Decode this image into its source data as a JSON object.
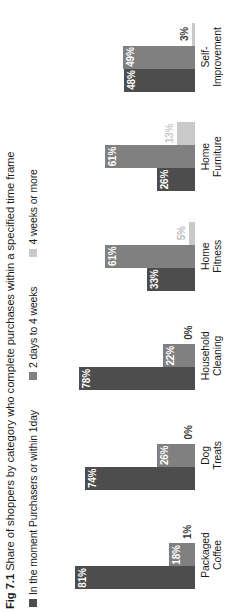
{
  "caption": {
    "figure_number": "Fig 7.1",
    "text": "Share of shoppers by category who complete purchases within a specified time frame"
  },
  "legend": {
    "items": [
      {
        "label": "In the moment Purchasers or within 1day",
        "color": "#4d4d4d"
      },
      {
        "label": "2 days to 4 weeks",
        "color": "#808080"
      },
      {
        "label": "4 weeks or more",
        "color": "#c9c9c9"
      }
    ]
  },
  "chart_data": {
    "type": "bar",
    "title": "Share of shoppers by category who complete purchases within a specified time frame",
    "xlabel": "",
    "ylabel": "",
    "ylim": [
      0,
      100
    ],
    "grid": false,
    "legend_position": "top-left",
    "categories": [
      "Packaged Coffee",
      "Dog Treats",
      "Household Cleaning",
      "Home Fitness",
      "Home Furniture",
      "Self-Improvement"
    ],
    "category_lines": [
      [
        "Packaged",
        "Coffee"
      ],
      [
        "Dog",
        "Treats"
      ],
      [
        "Household",
        "Cleaning"
      ],
      [
        "Home",
        "Fitness"
      ],
      [
        "Home",
        "Furniture"
      ],
      [
        "Self-",
        "Improvement"
      ]
    ],
    "series": [
      {
        "name": "In the moment Purchasers or within 1day",
        "color": "#4d4d4d",
        "values": [
          81,
          74,
          78,
          33,
          26,
          48
        ],
        "labels": [
          "81%",
          "74%",
          "78%",
          "33%",
          "26%",
          "48%"
        ]
      },
      {
        "name": "2 days to 4 weeks",
        "color": "#808080",
        "values": [
          18,
          26,
          22,
          61,
          61,
          49
        ],
        "labels": [
          "18%",
          "26%",
          "22%",
          "61%",
          "61%",
          "49%"
        ]
      },
      {
        "name": "4 weeks or more",
        "color": "#c9c9c9",
        "values": [
          1,
          0,
          0,
          5,
          13,
          3
        ],
        "labels": [
          "1%",
          "0%",
          "0%",
          "5%",
          "13%",
          "3%"
        ]
      }
    ]
  }
}
